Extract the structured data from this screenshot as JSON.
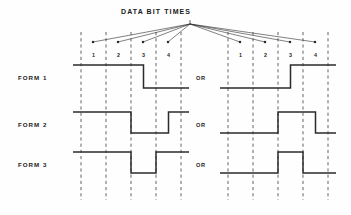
{
  "figure": {
    "title": "DATA BIT TIMES",
    "background_color": "#fefefe",
    "ink_color": "#2b2b2b",
    "dash_color": "#555555"
  },
  "row_labels": [
    {
      "label": "FORM 1"
    },
    {
      "label": "FORM 2"
    },
    {
      "label": "FORM 3"
    }
  ],
  "separators": [
    {
      "label": "OR"
    },
    {
      "label": "OR"
    },
    {
      "label": "OR"
    }
  ],
  "bit_numbers_left": [
    "1",
    "2",
    "3",
    "4"
  ],
  "bit_numbers_right": [
    "1",
    "2",
    "3",
    "4"
  ],
  "chart_data": {
    "type": "line",
    "title": "DATA BIT TIMES",
    "xlabel": "",
    "ylabel": "",
    "grid": true,
    "legend": "none",
    "bit_times": [
      1,
      2,
      3,
      4
    ],
    "groups": [
      {
        "name": "left",
        "x_pixels": [
          81,
          106,
          131,
          156,
          181
        ],
        "series": [
          {
            "name": "FORM 1",
            "levels": [
              1,
              1,
              0,
              0
            ],
            "pulses": [
              {
                "bit": 3,
                "at": "first-half",
                "level": 1
              }
            ]
          },
          {
            "name": "FORM 2",
            "levels": [
              1,
              1,
              0,
              0
            ],
            "pulses": [
              {
                "bit": 4,
                "at": "second-half",
                "level": 1
              }
            ]
          },
          {
            "name": "FORM 3",
            "levels": [
              1,
              1,
              0,
              1
            ],
            "pulses": []
          }
        ]
      },
      {
        "name": "right",
        "x_pixels": [
          228,
          253,
          278,
          303,
          328
        ],
        "series": [
          {
            "name": "FORM 1",
            "levels": [
              0,
              0,
              1,
              1
            ],
            "pulses": [
              {
                "bit": 3,
                "at": "first-half",
                "level": 0
              }
            ]
          },
          {
            "name": "FORM 2",
            "levels": [
              0,
              0,
              1,
              1
            ],
            "pulses": [
              {
                "bit": 4,
                "at": "second-half",
                "level": 0
              }
            ]
          },
          {
            "name": "FORM 3",
            "levels": [
              0,
              0,
              1,
              0
            ],
            "pulses": []
          }
        ]
      }
    ],
    "leader_lines": {
      "origin_pixel": [
        190,
        24
      ],
      "targets_pixels": [
        [
          93,
          42
        ],
        [
          118,
          42
        ],
        [
          143,
          42
        ],
        [
          168,
          42
        ],
        [
          240,
          42
        ],
        [
          265,
          42
        ],
        [
          290,
          42
        ],
        [
          315,
          42
        ]
      ]
    }
  }
}
